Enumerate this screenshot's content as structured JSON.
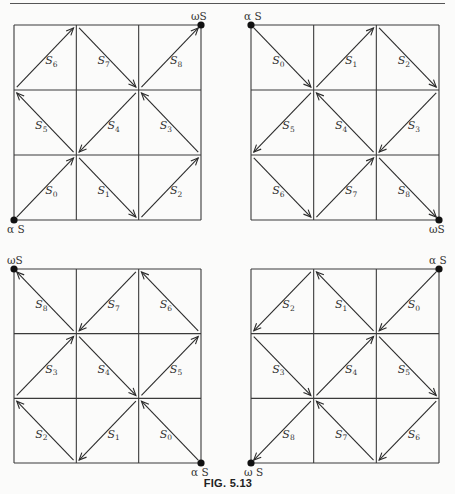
{
  "figure": {
    "caption": "FIG. 5.13",
    "grids": [
      {
        "id": "top-left",
        "alpha": {
          "label": "α S",
          "corner": "bottom-left"
        },
        "omega": {
          "label": "ωS",
          "corner": "top-right"
        },
        "cells": [
          {
            "name": "S",
            "index": "0",
            "col": 0,
            "row": 2,
            "from": "BL",
            "to": "TR"
          },
          {
            "name": "S",
            "index": "1",
            "col": 1,
            "row": 2,
            "from": "TL",
            "to": "BR"
          },
          {
            "name": "S",
            "index": "2",
            "col": 2,
            "row": 2,
            "from": "BL",
            "to": "TR"
          },
          {
            "name": "S",
            "index": "3",
            "col": 2,
            "row": 1,
            "from": "BR",
            "to": "TL"
          },
          {
            "name": "S",
            "index": "4",
            "col": 1,
            "row": 1,
            "from": "TR",
            "to": "BL"
          },
          {
            "name": "S",
            "index": "5",
            "col": 0,
            "row": 1,
            "from": "BR",
            "to": "TL"
          },
          {
            "name": "S",
            "index": "6",
            "col": 0,
            "row": 0,
            "from": "BL",
            "to": "TR"
          },
          {
            "name": "S",
            "index": "7",
            "col": 1,
            "row": 0,
            "from": "TL",
            "to": "BR"
          },
          {
            "name": "S",
            "index": "8",
            "col": 2,
            "row": 0,
            "from": "BL",
            "to": "TR"
          }
        ]
      },
      {
        "id": "top-right",
        "alpha": {
          "label": "α S",
          "corner": "top-left"
        },
        "omega": {
          "label": "ωS",
          "corner": "bottom-right"
        },
        "cells": [
          {
            "name": "S",
            "index": "0",
            "col": 0,
            "row": 0,
            "from": "TL",
            "to": "BR"
          },
          {
            "name": "S",
            "index": "1",
            "col": 1,
            "row": 0,
            "from": "BL",
            "to": "TR"
          },
          {
            "name": "S",
            "index": "2",
            "col": 2,
            "row": 0,
            "from": "TL",
            "to": "BR"
          },
          {
            "name": "S",
            "index": "3",
            "col": 2,
            "row": 1,
            "from": "TR",
            "to": "BL"
          },
          {
            "name": "S",
            "index": "4",
            "col": 1,
            "row": 1,
            "from": "BR",
            "to": "TL"
          },
          {
            "name": "S",
            "index": "5",
            "col": 0,
            "row": 1,
            "from": "TR",
            "to": "BL"
          },
          {
            "name": "S",
            "index": "6",
            "col": 0,
            "row": 2,
            "from": "TL",
            "to": "BR"
          },
          {
            "name": "S",
            "index": "7",
            "col": 1,
            "row": 2,
            "from": "BL",
            "to": "TR"
          },
          {
            "name": "S",
            "index": "8",
            "col": 2,
            "row": 2,
            "from": "TL",
            "to": "BR"
          }
        ]
      },
      {
        "id": "bottom-left",
        "alpha": {
          "label": "α S",
          "corner": "bottom-right"
        },
        "omega": {
          "label": "ωS",
          "corner": "top-left"
        },
        "cells": [
          {
            "name": "S",
            "index": "0",
            "col": 2,
            "row": 2,
            "from": "BR",
            "to": "TL"
          },
          {
            "name": "S",
            "index": "1",
            "col": 1,
            "row": 2,
            "from": "TR",
            "to": "BL"
          },
          {
            "name": "S",
            "index": "2",
            "col": 0,
            "row": 2,
            "from": "BR",
            "to": "TL"
          },
          {
            "name": "S",
            "index": "3",
            "col": 0,
            "row": 1,
            "from": "BL",
            "to": "TR"
          },
          {
            "name": "S",
            "index": "4",
            "col": 1,
            "row": 1,
            "from": "TL",
            "to": "BR"
          },
          {
            "name": "S",
            "index": "5",
            "col": 2,
            "row": 1,
            "from": "BL",
            "to": "TR"
          },
          {
            "name": "S",
            "index": "6",
            "col": 2,
            "row": 0,
            "from": "BR",
            "to": "TL"
          },
          {
            "name": "S",
            "index": "7",
            "col": 1,
            "row": 0,
            "from": "TR",
            "to": "BL"
          },
          {
            "name": "S",
            "index": "8",
            "col": 0,
            "row": 0,
            "from": "BR",
            "to": "TL"
          }
        ]
      },
      {
        "id": "bottom-right",
        "alpha": {
          "label": "α S",
          "corner": "top-right"
        },
        "omega": {
          "label": "ω S",
          "corner": "bottom-left"
        },
        "cells": [
          {
            "name": "S",
            "index": "0",
            "col": 2,
            "row": 0,
            "from": "TR",
            "to": "BL"
          },
          {
            "name": "S",
            "index": "1",
            "col": 1,
            "row": 0,
            "from": "BR",
            "to": "TL"
          },
          {
            "name": "S",
            "index": "2",
            "col": 0,
            "row": 0,
            "from": "TR",
            "to": "BL"
          },
          {
            "name": "S",
            "index": "3",
            "col": 0,
            "row": 1,
            "from": "TL",
            "to": "BR"
          },
          {
            "name": "S",
            "index": "4",
            "col": 1,
            "row": 1,
            "from": "BL",
            "to": "TR"
          },
          {
            "name": "S",
            "index": "5",
            "col": 2,
            "row": 1,
            "from": "TL",
            "to": "BR"
          },
          {
            "name": "S",
            "index": "6",
            "col": 2,
            "row": 2,
            "from": "TR",
            "to": "BL"
          },
          {
            "name": "S",
            "index": "7",
            "col": 1,
            "row": 2,
            "from": "BR",
            "to": "TL"
          },
          {
            "name": "S",
            "index": "8",
            "col": 0,
            "row": 2,
            "from": "TR",
            "to": "BL"
          }
        ]
      }
    ]
  }
}
